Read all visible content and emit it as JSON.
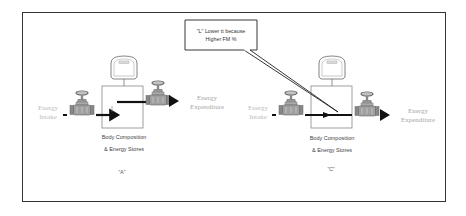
{
  "callout": {
    "line1": "\"L\" Lower tt because",
    "line2": "Higher FM %"
  },
  "panels": [
    {
      "id": "A",
      "intake_line1": "Energy",
      "intake_line2": "Intake",
      "expenditure_line1": "Energy",
      "expenditure_line2": "Expenditure",
      "stores_line1": "Body Composition",
      "stores_line2": "& Energy Stores",
      "label": "\"A\"",
      "thermostat_label": "Balance"
    },
    {
      "id": "C",
      "intake_line1": "Energy",
      "intake_line2": "Intake",
      "expenditure_line1": "Energy",
      "expenditure_line2": "Expenditure",
      "stores_line1": "Body Composition",
      "stores_line2": "& Energy Stores",
      "label": "\"C\"",
      "thermostat_label": "Balance"
    }
  ],
  "colors": {
    "frame": "#333333",
    "arrow": "#111111",
    "valve": "#777777",
    "faint_text": "#bdbdbd"
  }
}
